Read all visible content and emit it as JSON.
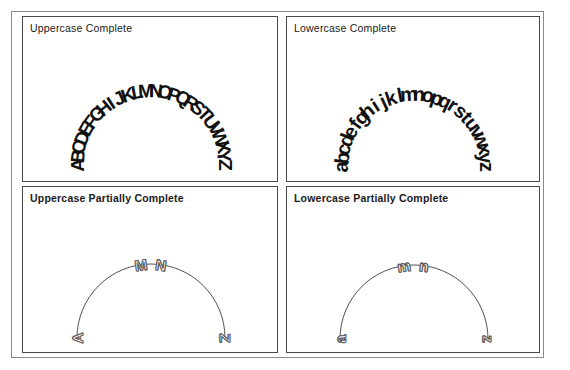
{
  "figure": {
    "background_color": "#ffffff",
    "frame_color": "#8a8a8a",
    "panel_border_color": "#4a4a4a",
    "text_color": "#1a1a1a",
    "arc_stroke_color": "#3c3c3c",
    "hollow_letter_stroke_color": "#666666"
  },
  "panels": {
    "uppercase_complete": {
      "title": "Uppercase Complete",
      "letters": [
        "A",
        "B",
        "C",
        "D",
        "E",
        "F",
        "G",
        "H",
        "I",
        "J",
        "K",
        "L",
        "M",
        "N",
        "O",
        "P",
        "Q",
        "R",
        "S",
        "T",
        "U",
        "V",
        "W",
        "X",
        "Y",
        "Z"
      ],
      "arc_visible": false,
      "letter_style": "solid-bold"
    },
    "lowercase_complete": {
      "title": "Lowercase Complete",
      "letters": [
        "a",
        "b",
        "c",
        "d",
        "e",
        "f",
        "g",
        "h",
        "i",
        "j",
        "k",
        "l",
        "m",
        "n",
        "o",
        "p",
        "q",
        "r",
        "s",
        "t",
        "u",
        "v",
        "w",
        "x",
        "y",
        "z"
      ],
      "arc_visible": false,
      "letter_style": "solid-bold"
    },
    "uppercase_partial": {
      "title": "Uppercase Partially Complete",
      "letters": [
        "A",
        "M",
        "N",
        "Z"
      ],
      "start_label": "A",
      "middle_label": "MN",
      "end_label": "Z",
      "arc_visible": true,
      "letter_style": "outline-hollow"
    },
    "lowercase_partial": {
      "title": "Lowercase Partially Complete",
      "letters": [
        "a",
        "m",
        "n",
        "z"
      ],
      "start_label": "a",
      "middle_label": "mn",
      "end_label": "z",
      "arc_visible": true,
      "letter_style": "outline-hollow"
    }
  },
  "chart_data": {
    "type": "scatter",
    "title": "",
    "subtitle": "",
    "xlabel": "",
    "ylabel": "",
    "layout": {
      "rows": 2,
      "cols": 2,
      "grid": false,
      "legend": "none"
    },
    "arc_geometry": {
      "sweep_degrees": 180,
      "start_angle_deg": 180,
      "end_angle_deg": 0,
      "direction": "counterclockwise-top"
    },
    "series": [
      {
        "name": "Uppercase Complete",
        "panel": "top-left",
        "n_points": 26,
        "values": [
          "A",
          "B",
          "C",
          "D",
          "E",
          "F",
          "G",
          "H",
          "I",
          "J",
          "K",
          "L",
          "M",
          "N",
          "O",
          "P",
          "Q",
          "R",
          "S",
          "T",
          "U",
          "V",
          "W",
          "X",
          "Y",
          "Z"
        ]
      },
      {
        "name": "Lowercase Complete",
        "panel": "top-right",
        "n_points": 26,
        "values": [
          "a",
          "b",
          "c",
          "d",
          "e",
          "f",
          "g",
          "h",
          "i",
          "j",
          "k",
          "l",
          "m",
          "n",
          "o",
          "p",
          "q",
          "r",
          "s",
          "t",
          "u",
          "v",
          "w",
          "x",
          "y",
          "z"
        ]
      },
      {
        "name": "Uppercase Partially Complete",
        "panel": "bottom-left",
        "n_points": 4,
        "values": [
          "A",
          "M",
          "N",
          "Z"
        ]
      },
      {
        "name": "Lowercase Partially Complete",
        "panel": "bottom-right",
        "n_points": 4,
        "values": [
          "a",
          "m",
          "n",
          "z"
        ]
      }
    ]
  }
}
